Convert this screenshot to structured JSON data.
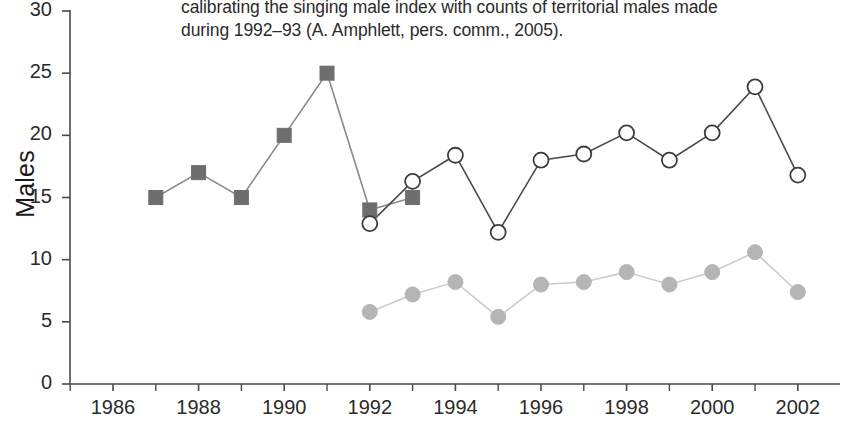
{
  "caption": {
    "line1": "calibrating the singing male index with counts of territorial males made",
    "line2": "during 1992–93 (A. Amphlett, pers. comm., 2005)."
  },
  "chart_data": {
    "type": "line",
    "title": "",
    "xlabel": "",
    "ylabel": "Males",
    "xlim": [
      1985,
      2003
    ],
    "ylim": [
      0,
      30
    ],
    "xticks": [
      1986,
      1988,
      1990,
      1992,
      1994,
      1996,
      1998,
      2000,
      2002
    ],
    "xtick_labels": [
      "1986",
      "1988",
      "1990",
      "1992",
      "1994",
      "1996",
      "1998",
      "2000",
      "2002"
    ],
    "xminor_ticks": [
      1985,
      1987,
      1989,
      1991,
      1993,
      1995,
      1997,
      1999,
      2001,
      2003
    ],
    "yticks": [
      0,
      5,
      10,
      15,
      20,
      25,
      30
    ],
    "ytick_labels": [
      "0",
      "5",
      "10",
      "15",
      "20",
      "25",
      "30"
    ],
    "grid": false,
    "legend": "none",
    "series": [
      {
        "name": "territorial-male-counts",
        "marker": "filled-square",
        "color": "#6e6e6e",
        "line_color": "#8a8a8a",
        "x": [
          1987,
          1988,
          1989,
          1990,
          1991,
          1992,
          1993
        ],
        "values": [
          15,
          17,
          15,
          20,
          25,
          14,
          15
        ]
      },
      {
        "name": "singing-male-index-upper",
        "marker": "open-circle",
        "color": "#ffffff",
        "line_color": "#4a4a4a",
        "x": [
          1992,
          1993,
          1994,
          1995,
          1996,
          1997,
          1998,
          1999,
          2000,
          2001,
          2002
        ],
        "values": [
          12.9,
          16.3,
          18.4,
          12.2,
          18.0,
          18.5,
          20.2,
          18.0,
          20.2,
          23.9,
          16.8
        ]
      },
      {
        "name": "singing-male-index-lower",
        "marker": "filled-circle",
        "color": "#b5b5b5",
        "line_color": "#cccccc",
        "x": [
          1992,
          1993,
          1994,
          1995,
          1996,
          1997,
          1998,
          1999,
          2000,
          2001,
          2002
        ],
        "values": [
          5.8,
          7.2,
          8.2,
          5.4,
          8.0,
          8.2,
          9.0,
          8.0,
          9.0,
          10.6,
          7.4
        ]
      }
    ]
  }
}
